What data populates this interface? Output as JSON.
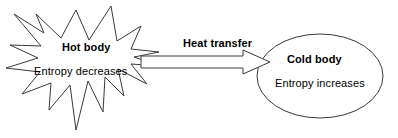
{
  "diagram": {
    "background_color": "#ffffff",
    "stroke_color": "#3a3a3a",
    "text_color": "#000000",
    "hot_body": {
      "shape": "starburst",
      "title": "Hot body",
      "subtitle": "Entropy decreases"
    },
    "cold_body": {
      "shape": "ellipse",
      "title": "Cold body",
      "subtitle": "Entropy increases"
    },
    "arrow": {
      "shape": "block-arrow-right",
      "label": "Heat transfer",
      "direction": "left-to-right"
    }
  }
}
